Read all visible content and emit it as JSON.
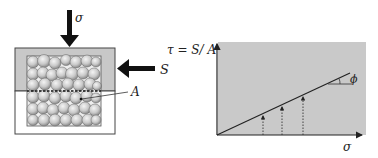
{
  "diagram": {
    "left": {
      "normal_force_label": "σ",
      "shear_force_label": "S",
      "shear_plane_label": "A"
    },
    "right": {
      "y_axis_label": "τ = S/ A",
      "x_axis_label": "σ",
      "angle_label": "ϕ"
    },
    "colors": {
      "box_fill_upper": "#c8c8c8",
      "box_fill_lower": "#ffffff",
      "particle_fill": "#d4d4d4",
      "chart_fill": "#c9c9c9",
      "line": "#222222"
    }
  }
}
